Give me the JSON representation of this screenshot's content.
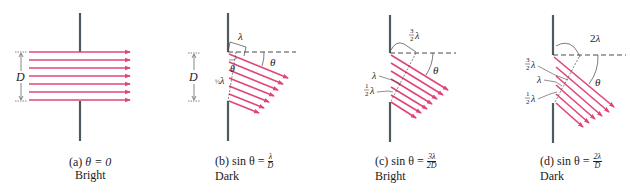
{
  "figure": {
    "colors": {
      "ray": "#e0457a",
      "wall": "#4f5a60",
      "text": "#222222",
      "dashed": "#333333"
    },
    "symbols": {
      "D": "D",
      "theta": "θ",
      "lambda": "λ"
    },
    "panels": [
      {
        "id": "a",
        "caption_prefix": "(a)",
        "caption_formula": "θ = 0",
        "caption_result": "Bright",
        "labels": [
          "D"
        ]
      },
      {
        "id": "b",
        "caption_prefix": "(b)",
        "caption_formula": "sin θ =",
        "fraction_num": "λ",
        "fraction_den": "D",
        "caption_result": "Dark",
        "labels": [
          "D",
          "λ",
          "θ",
          "θ",
          "½λ"
        ],
        "path_diff_top": "λ",
        "path_diff_mid": "1/2 λ"
      },
      {
        "id": "c",
        "caption_prefix": "(c)",
        "caption_formula": "sin θ =",
        "fraction_num": "3λ",
        "fraction_den": "2D",
        "caption_result": "Bright",
        "labels": [
          "3/2 λ",
          "λ",
          "1/2 λ",
          "θ"
        ],
        "path_diff_top": "3/2 λ",
        "path_diff_mid": "λ",
        "path_diff_low": "1/2 λ"
      },
      {
        "id": "d",
        "caption_prefix": "(d)",
        "caption_formula": "sin θ =",
        "fraction_num": "2λ",
        "fraction_den": "D",
        "caption_result": "Dark",
        "labels": [
          "2λ",
          "3/2 λ",
          "λ",
          "1/2 λ",
          "θ"
        ],
        "path_diff_top": "2λ",
        "path_diff_2": "3/2 λ",
        "path_diff_3": "λ",
        "path_diff_4": "1/2 λ"
      }
    ]
  }
}
